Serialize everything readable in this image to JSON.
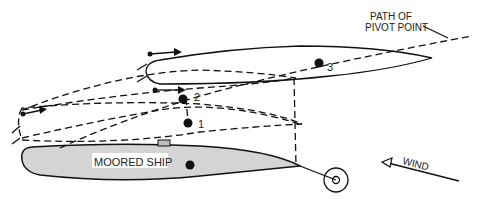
{
  "diagram": {
    "labels": {
      "path_line1": "PATH OF",
      "path_line2": "PIVOT POINT",
      "moored_ship": "MOORED SHIP",
      "wind": "WIND"
    },
    "positions": [
      {
        "id": "1",
        "label": "1"
      },
      {
        "id": "2",
        "label": "2"
      },
      {
        "id": "3",
        "label": "3"
      }
    ],
    "icons": {
      "pivot_point": "filled-circle",
      "thrust": "arrow-right",
      "anchor_buoy": "double-circle",
      "wind_arrow": "arrow-upper-left"
    },
    "colors": {
      "line": "#111111",
      "moored_fill": "#d4d4d4",
      "background": "#ffffff"
    }
  }
}
